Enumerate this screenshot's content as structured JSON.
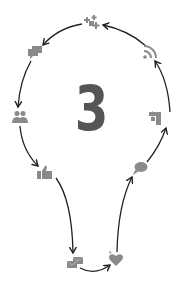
{
  "diagram": {
    "center_label": "3",
    "center_color": "#555555",
    "icon_color": "#8a8a8a",
    "arrow_color": "#222222",
    "cycle_direction": "counter-clockwise",
    "nodes": [
      {
        "id": "puzzle",
        "icon": "puzzle-icon",
        "x": 91,
        "y": 22
      },
      {
        "id": "chat",
        "icon": "chat-icon",
        "x": 35,
        "y": 52
      },
      {
        "id": "users",
        "icon": "users-icon",
        "x": 20,
        "y": 117
      },
      {
        "id": "thumbs-up",
        "icon": "thumbs-up-icon",
        "x": 45,
        "y": 172
      },
      {
        "id": "mail",
        "icon": "mail-icon",
        "x": 75,
        "y": 262
      },
      {
        "id": "heart",
        "icon": "heart-icon",
        "x": 116,
        "y": 259
      },
      {
        "id": "speech-bubble",
        "icon": "speech-bubble-icon",
        "x": 140,
        "y": 168
      },
      {
        "id": "share",
        "icon": "share-icon",
        "x": 155,
        "y": 118
      },
      {
        "id": "rss",
        "icon": "rss-icon",
        "x": 150,
        "y": 52
      }
    ],
    "edges": [
      {
        "from": "puzzle",
        "to": "chat"
      },
      {
        "from": "chat",
        "to": "users"
      },
      {
        "from": "users",
        "to": "thumbs-up"
      },
      {
        "from": "thumbs-up",
        "to": "mail"
      },
      {
        "from": "mail",
        "to": "heart"
      },
      {
        "from": "heart",
        "to": "speech-bubble"
      },
      {
        "from": "speech-bubble",
        "to": "share"
      },
      {
        "from": "share",
        "to": "rss"
      },
      {
        "from": "rss",
        "to": "puzzle"
      }
    ]
  }
}
